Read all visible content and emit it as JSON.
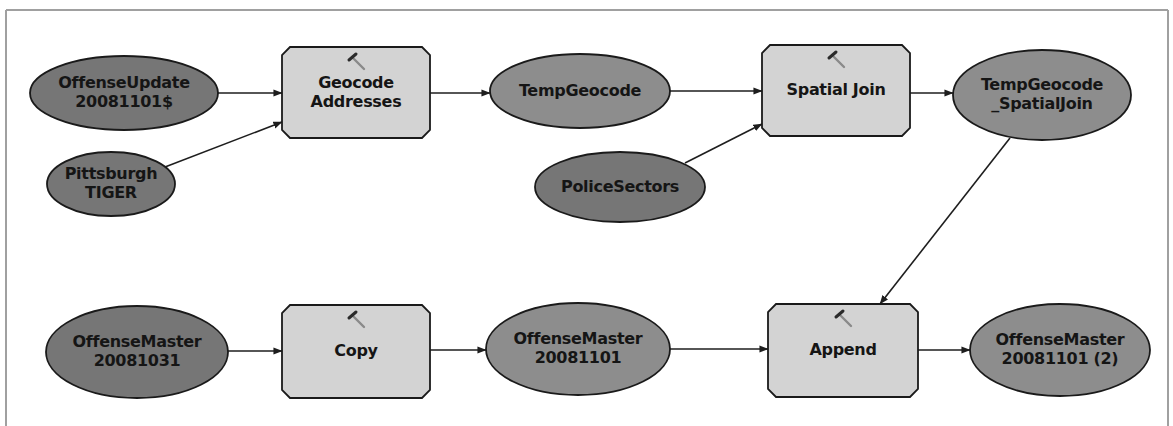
{
  "diagram": {
    "title": "",
    "colors": {
      "input_data": "#767676",
      "derived_data": "#8d8d8d",
      "tool": "#d3d3d3",
      "outline": "#1a1a1a",
      "connector": "#1e1e1e",
      "frame": "#a0a0a0"
    },
    "frame": {
      "left": 6,
      "top": 10,
      "right": 1168
    },
    "nodes": [
      {
        "id": "offense_update",
        "type": "input_data",
        "shape": "ellipse",
        "cx": 124,
        "cy": 93,
        "rx": 94,
        "ry": 37,
        "lines": [
          "OffenseUpdate",
          "20081101$"
        ]
      },
      {
        "id": "pittsburgh_tiger",
        "type": "input_data",
        "shape": "ellipse",
        "cx": 111,
        "cy": 184,
        "rx": 64,
        "ry": 32,
        "lines": [
          "Pittsburgh",
          "TIGER"
        ]
      },
      {
        "id": "geocode_addresses",
        "type": "tool",
        "shape": "box",
        "x": 282,
        "y": 47,
        "w": 148,
        "h": 91,
        "lines": [
          "Geocode",
          "Addresses"
        ],
        "icon": "hammer-icon"
      },
      {
        "id": "temp_geocode",
        "type": "derived_data",
        "shape": "ellipse",
        "cx": 580,
        "cy": 91,
        "rx": 90,
        "ry": 37,
        "lines": [
          "TempGeocode"
        ]
      },
      {
        "id": "police_sectors",
        "type": "input_data",
        "shape": "ellipse",
        "cx": 620,
        "cy": 187,
        "rx": 85,
        "ry": 35,
        "lines": [
          "PoliceSectors"
        ]
      },
      {
        "id": "spatial_join",
        "type": "tool",
        "shape": "box",
        "x": 762,
        "y": 45,
        "w": 148,
        "h": 91,
        "lines": [
          "Spatial Join"
        ],
        "icon": "hammer-icon"
      },
      {
        "id": "temp_geocode_spatialjoin",
        "type": "derived_data",
        "shape": "ellipse",
        "cx": 1042,
        "cy": 95,
        "rx": 89,
        "ry": 45,
        "lines": [
          "TempGeocode",
          "_SpatialJoin"
        ]
      },
      {
        "id": "offense_master_20081031",
        "type": "input_data",
        "shape": "ellipse",
        "cx": 137,
        "cy": 352,
        "rx": 91,
        "ry": 46,
        "lines": [
          "OffenseMaster",
          "20081031"
        ]
      },
      {
        "id": "copy",
        "type": "tool",
        "shape": "box",
        "x": 282,
        "y": 305,
        "w": 148,
        "h": 93,
        "lines": [
          "Copy"
        ],
        "icon": "hammer-icon"
      },
      {
        "id": "offense_master_20081101",
        "type": "derived_data",
        "shape": "ellipse",
        "cx": 578,
        "cy": 349,
        "rx": 92,
        "ry": 46,
        "lines": [
          "OffenseMaster",
          "20081101"
        ]
      },
      {
        "id": "append",
        "type": "tool",
        "shape": "box",
        "x": 768,
        "y": 304,
        "w": 150,
        "h": 93,
        "lines": [
          "Append"
        ],
        "icon": "hammer-icon"
      },
      {
        "id": "offense_master_20081101_2",
        "type": "derived_data",
        "shape": "ellipse",
        "cx": 1060,
        "cy": 350,
        "rx": 90,
        "ry": 46,
        "lines": [
          "OffenseMaster",
          "20081101 (2)"
        ]
      }
    ],
    "connectors": [
      {
        "from": "offense_update",
        "to": "geocode_addresses",
        "x1": 218,
        "y1": 93,
        "x2": 282,
        "y2": 93
      },
      {
        "from": "pittsburgh_tiger",
        "to": "geocode_addresses",
        "x1": 165,
        "y1": 167,
        "x2": 282,
        "y2": 122
      },
      {
        "from": "geocode_addresses",
        "to": "temp_geocode",
        "x1": 430,
        "y1": 93,
        "x2": 490,
        "y2": 93
      },
      {
        "from": "temp_geocode",
        "to": "spatial_join",
        "x1": 670,
        "y1": 91,
        "x2": 762,
        "y2": 91
      },
      {
        "from": "police_sectors",
        "to": "spatial_join",
        "x1": 685,
        "y1": 163,
        "x2": 762,
        "y2": 124
      },
      {
        "from": "spatial_join",
        "to": "temp_geocode_spatialjoin",
        "x1": 910,
        "y1": 93,
        "x2": 953,
        "y2": 93
      },
      {
        "from": "temp_geocode_spatialjoin",
        "to": "append",
        "x1": 1010,
        "y1": 138,
        "x2": 880,
        "y2": 304
      },
      {
        "from": "offense_master_20081031",
        "to": "copy",
        "x1": 228,
        "y1": 351,
        "x2": 282,
        "y2": 351
      },
      {
        "from": "copy",
        "to": "offense_master_20081101",
        "x1": 430,
        "y1": 350,
        "x2": 486,
        "y2": 350
      },
      {
        "from": "offense_master_20081101",
        "to": "append",
        "x1": 670,
        "y1": 349,
        "x2": 768,
        "y2": 349
      },
      {
        "from": "append",
        "to": "offense_master_20081101_2",
        "x1": 918,
        "y1": 350,
        "x2": 970,
        "y2": 350
      }
    ]
  }
}
